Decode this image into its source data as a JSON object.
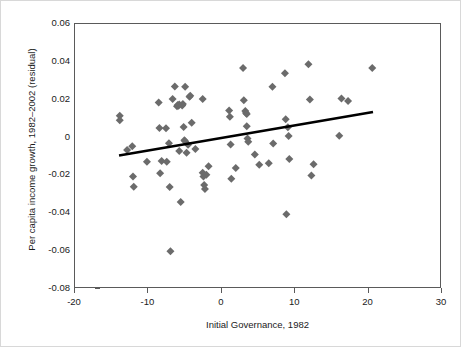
{
  "chart_data": {
    "type": "scatter",
    "title": "",
    "xlabel": "Initial Governance, 1982",
    "ylabel": "Per capita income growth, 1982–2002 (residual)",
    "xlim": [
      -20,
      30
    ],
    "ylim": [
      -0.08,
      0.06
    ],
    "xticks": [
      -20,
      -10,
      0,
      10,
      20,
      30
    ],
    "xticklabels": [
      "-20",
      "-10",
      "0",
      "10",
      "20",
      "30"
    ],
    "yticks": [
      0.06,
      0.04,
      0.02,
      0,
      -0.02,
      -0.04,
      -0.06,
      -0.08
    ],
    "yticklabels": [
      "0.06",
      "0.04",
      "0.02",
      "0",
      "-0.02",
      "-0.04",
      "-0.06",
      "-0.08"
    ],
    "grid": false,
    "legend": null,
    "marker": "diamond",
    "marker_color": "#6b6b6b",
    "marker_size": 4,
    "trendline": {
      "type": "linear",
      "color": "#000000",
      "width": 2.6,
      "x0": -14.0,
      "y0": -0.0095,
      "x1": 20.6,
      "y1": 0.0135
    },
    "points": [
      [
        -13.9,
        0.0115
      ],
      [
        -13.9,
        0.0092
      ],
      [
        -12.9,
        -0.0065
      ],
      [
        -12.2,
        -0.0046
      ],
      [
        -12.1,
        -0.0205
      ],
      [
        -12.0,
        -0.026
      ],
      [
        -10.2,
        -0.0128
      ],
      [
        -8.6,
        0.0185
      ],
      [
        -8.5,
        0.0051
      ],
      [
        -8.4,
        -0.0189
      ],
      [
        -8.2,
        -0.0124
      ],
      [
        -7.6,
        0.0049
      ],
      [
        -7.5,
        -0.0128
      ],
      [
        -7.2,
        -0.003
      ],
      [
        -7.1,
        -0.0261
      ],
      [
        -7.0,
        -0.06
      ],
      [
        -6.7,
        0.0204
      ],
      [
        -6.4,
        0.027
      ],
      [
        -6.1,
        0.0165
      ],
      [
        -6.0,
        0.0172
      ],
      [
        -5.9,
        0.0168
      ],
      [
        -5.8,
        0.0175
      ],
      [
        -5.8,
        -0.0071
      ],
      [
        -5.6,
        -0.034
      ],
      [
        -5.4,
        0.017
      ],
      [
        -5.3,
        0.0177
      ],
      [
        -5.2,
        0.0056
      ],
      [
        -5.1,
        -0.0014
      ],
      [
        -5.0,
        -0.002
      ],
      [
        -5.0,
        0.0268
      ],
      [
        -4.8,
        -0.008
      ],
      [
        -4.6,
        -0.0038
      ],
      [
        -4.4,
        0.0216
      ],
      [
        -4.3,
        0.0221
      ],
      [
        -4.1,
        0.0078
      ],
      [
        -3.6,
        -0.006
      ],
      [
        -2.6,
        0.0204
      ],
      [
        -2.6,
        -0.0186
      ],
      [
        -2.5,
        -0.0205
      ],
      [
        -2.4,
        -0.025
      ],
      [
        -2.3,
        -0.0272
      ],
      [
        -2.1,
        -0.0196
      ],
      [
        -1.8,
        -0.0152
      ],
      [
        1.0,
        0.0143
      ],
      [
        1.1,
        0.011
      ],
      [
        1.2,
        -0.0036
      ],
      [
        1.3,
        -0.0218
      ],
      [
        1.9,
        -0.0161
      ],
      [
        2.9,
        0.0368
      ],
      [
        3.0,
        0.0197
      ],
      [
        3.2,
        0.014
      ],
      [
        3.3,
        0.013
      ],
      [
        3.4,
        0.0125
      ],
      [
        3.4,
        0.006
      ],
      [
        3.5,
        -0.0005
      ],
      [
        3.6,
        -0.0022
      ],
      [
        4.5,
        -0.0089
      ],
      [
        5.1,
        -0.0143
      ],
      [
        6.4,
        -0.0135
      ],
      [
        6.9,
        0.0268
      ],
      [
        7.0,
        -0.0031
      ],
      [
        8.6,
        0.034
      ],
      [
        8.7,
        0.0097
      ],
      [
        8.8,
        -0.0405
      ],
      [
        9.0,
        0.0055
      ],
      [
        9.1,
        0.0008
      ],
      [
        9.2,
        -0.0113
      ],
      [
        11.8,
        0.0387
      ],
      [
        12.0,
        0.0201
      ],
      [
        12.2,
        -0.0201
      ],
      [
        12.5,
        -0.0141
      ],
      [
        16.0,
        0.0009
      ],
      [
        16.3,
        0.0207
      ],
      [
        17.2,
        0.0193
      ],
      [
        20.5,
        0.0367
      ]
    ]
  }
}
